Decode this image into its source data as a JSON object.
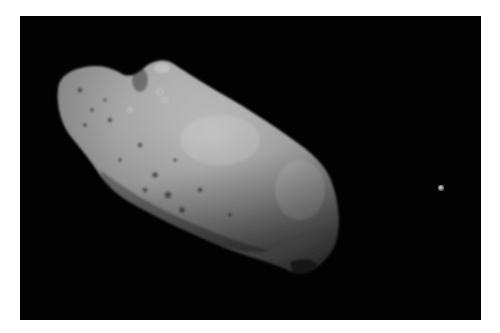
{
  "image": {
    "subject": "Asteroid with small moon",
    "description": "Grayscale photo of an elongated, cratered asteroid against black space with a tiny moon to the right",
    "frame": {
      "left": 20,
      "top": 16,
      "width": 461,
      "height": 304,
      "background": "#020202",
      "border_color": "#ffffff"
    },
    "objects": [
      {
        "name": "asteroid",
        "bbox": [
          55,
          62,
          340,
          276
        ],
        "tone": "light gray, cratered"
      },
      {
        "name": "moon",
        "center": [
          441,
          188
        ],
        "diameter": 6,
        "tone": "gray"
      }
    ]
  }
}
